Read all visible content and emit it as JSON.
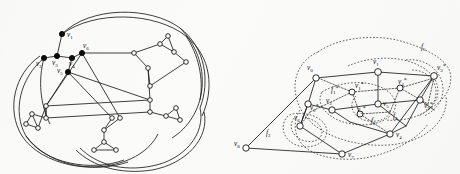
{
  "figure": {
    "background_color": "#fbfbf9",
    "ink_color": "#111111",
    "dual_color": "#3a3a3a"
  },
  "left_panel": {
    "name": "left-graph",
    "description": "Symmetric 5-fold graph drawing with outer arcs, open circle vertices and six filled labeled vertices",
    "vertex_style_open": "open-circle",
    "vertex_style_labeled": "filled-circle",
    "labels": [
      {
        "id": "v1",
        "base": "v",
        "sub": "1",
        "x": 63,
        "y": 38
      },
      {
        "id": "v2",
        "base": "v",
        "sub": "2",
        "x": 43,
        "y": 62
      },
      {
        "id": "v3",
        "base": "v",
        "sub": "3",
        "x": 57,
        "y": 62
      },
      {
        "id": "v4",
        "base": "v",
        "sub": "4",
        "x": 73,
        "y": 62
      },
      {
        "id": "v5",
        "base": "v",
        "sub": "5",
        "x": 60,
        "y": 74
      },
      {
        "id": "v6",
        "base": "v",
        "sub": "6",
        "x": 85,
        "y": 45
      }
    ]
  },
  "right_panel": {
    "name": "right-graph-with-dual",
    "description": "Planar graph with dashed dual overlay, labeled primal vertices, starred dual vertices and face labels",
    "vertex_labels": [
      {
        "id": "v0",
        "base": "v",
        "sub": "0",
        "star": false,
        "x": 312,
        "y": 69
      },
      {
        "id": "v1",
        "base": "v",
        "sub": "1",
        "star": false,
        "x": 377,
        "y": 64
      },
      {
        "id": "v3",
        "base": "v",
        "sub": "3",
        "star": false,
        "x": 341,
        "y": 98
      },
      {
        "id": "v5",
        "base": "v",
        "sub": "5",
        "star": false,
        "x": 383,
        "y": 100
      },
      {
        "id": "v4",
        "base": "v",
        "sub": "4",
        "star": false,
        "x": 398,
        "y": 131
      },
      {
        "id": "v6",
        "base": "v",
        "sub": "6",
        "star": false,
        "x": 297,
        "y": 119
      },
      {
        "id": "v7",
        "base": "v",
        "sub": "7",
        "star": false,
        "x": 348,
        "y": 152
      },
      {
        "id": "v8",
        "base": "v",
        "sub": "8",
        "star": false,
        "x": 237,
        "y": 143
      }
    ],
    "dual_vertex_labels": [
      {
        "id": "v1s",
        "base": "v",
        "sub": "1",
        "star": true,
        "x": 358,
        "y": 87
      },
      {
        "id": "v2s",
        "base": "v",
        "sub": "2",
        "star": true,
        "x": 312,
        "y": 107
      },
      {
        "id": "v3s",
        "base": "v",
        "sub": "3",
        "star": true,
        "x": 440,
        "y": 70
      },
      {
        "id": "v4s",
        "base": "v",
        "sub": "4",
        "star": true,
        "x": 403,
        "y": 95
      },
      {
        "id": "v5s",
        "base": "v",
        "sub": "5",
        "star": true,
        "x": 366,
        "y": 110
      },
      {
        "id": "v2b",
        "base": "v",
        "sub": "2",
        "star": true,
        "x": 433,
        "y": 105
      }
    ],
    "face_labels": [
      {
        "id": "f1",
        "base": "f",
        "sub": "1",
        "star": true,
        "x": 334,
        "y": 90
      },
      {
        "id": "f2",
        "base": "f",
        "sub": "2",
        "star": false,
        "x": 270,
        "y": 133
      },
      {
        "id": "f3",
        "base": "f",
        "sub": "3",
        "star": false,
        "x": 375,
        "y": 121
      },
      {
        "id": "f4",
        "base": "f",
        "sub": "4",
        "star": false,
        "x": 396,
        "y": 117
      },
      {
        "id": "f5",
        "base": "f",
        "sub": "5",
        "star": false,
        "x": 425,
        "y": 48
      }
    ]
  }
}
